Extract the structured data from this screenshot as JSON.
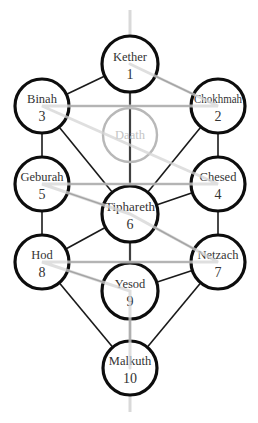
{
  "diagram": {
    "colors": {
      "node_stroke": "#0d0d0d",
      "path_stroke": "#1a1a1a",
      "hidden_node_stroke": "#b8b8b8",
      "lightning_flash": "#d4d4d4",
      "middle_pillar": "#d9d9d9",
      "text": "#333333"
    },
    "sephiroth": [
      {
        "id": "kether",
        "name": "Kether",
        "number": "1",
        "x": 130,
        "y": 64,
        "r": 28
      },
      {
        "id": "chokhmah",
        "name": "Chokhmah",
        "number": "2",
        "x": 218,
        "y": 106,
        "r": 27
      },
      {
        "id": "binah",
        "name": "Binah",
        "number": "3",
        "x": 42,
        "y": 106,
        "r": 27
      },
      {
        "id": "chesed",
        "name": "Chesed",
        "number": "4",
        "x": 218,
        "y": 184,
        "r": 27
      },
      {
        "id": "geburah",
        "name": "Geburah",
        "number": "5",
        "x": 42,
        "y": 184,
        "r": 27
      },
      {
        "id": "tiphareth",
        "name": "Tiphareth",
        "number": "6",
        "x": 130,
        "y": 214,
        "r": 28
      },
      {
        "id": "netzach",
        "name": "Netzach",
        "number": "7",
        "x": 218,
        "y": 262,
        "r": 27
      },
      {
        "id": "hod",
        "name": "Hod",
        "number": "8",
        "x": 42,
        "y": 262,
        "r": 27
      },
      {
        "id": "yesod",
        "name": "Yesod",
        "number": "9",
        "x": 130,
        "y": 291,
        "r": 28
      },
      {
        "id": "malkuth",
        "name": "Malkuth",
        "number": "10",
        "x": 130,
        "y": 368,
        "r": 27
      }
    ],
    "hidden_sephirah": {
      "id": "daath",
      "name": "Daath",
      "x": 130,
      "y": 135,
      "r": 27
    },
    "paths": [
      [
        "kether",
        "chokhmah"
      ],
      [
        "kether",
        "binah"
      ],
      [
        "kether",
        "tiphareth"
      ],
      [
        "chokhmah",
        "binah"
      ],
      [
        "chokhmah",
        "chesed"
      ],
      [
        "chokhmah",
        "tiphareth"
      ],
      [
        "binah",
        "geburah"
      ],
      [
        "binah",
        "tiphareth"
      ],
      [
        "chesed",
        "geburah"
      ],
      [
        "chesed",
        "tiphareth"
      ],
      [
        "chesed",
        "netzach"
      ],
      [
        "geburah",
        "tiphareth"
      ],
      [
        "geburah",
        "hod"
      ],
      [
        "tiphareth",
        "netzach"
      ],
      [
        "tiphareth",
        "hod"
      ],
      [
        "tiphareth",
        "yesod"
      ],
      [
        "netzach",
        "hod"
      ],
      [
        "netzach",
        "yesod"
      ],
      [
        "netzach",
        "malkuth"
      ],
      [
        "hod",
        "yesod"
      ],
      [
        "hod",
        "malkuth"
      ],
      [
        "yesod",
        "malkuth"
      ]
    ],
    "lightning_flash": [
      "kether",
      "chokhmah",
      "binah",
      "chesed",
      "geburah",
      "tiphareth",
      "netzach",
      "hod",
      "yesod",
      "malkuth"
    ],
    "middle_pillar": {
      "x": 130,
      "y_top": 10,
      "y_bottom": 412
    }
  }
}
